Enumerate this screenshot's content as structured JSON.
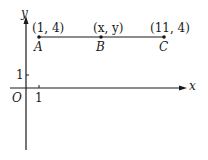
{
  "diagram": {
    "type": "coordinate-plane",
    "axes": {
      "x_label": "x",
      "y_label": "y",
      "origin_label": "O",
      "x_tick_label": "1",
      "y_tick_label": "1"
    },
    "points": [
      {
        "name": "A",
        "coords": "(1, 4)"
      },
      {
        "name": "B",
        "coords": "(x, y)"
      },
      {
        "name": "C",
        "coords": "(11, 4)"
      }
    ],
    "segment": "AC",
    "colors": {
      "line": "#1a1a1a",
      "background": "#ffffff"
    }
  }
}
